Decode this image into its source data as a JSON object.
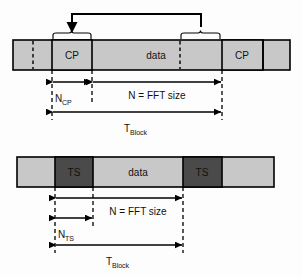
{
  "figure": {
    "title": "",
    "type": "timing-diagram",
    "colors": {
      "page_background": "#fdfdfd",
      "block_fill_light": "#c8c8c8",
      "block_fill_data": "#c8c8c8",
      "block_fill_ts": "#4a4a4a",
      "outline": "#000000",
      "text": "#111111"
    }
  },
  "diagrams": [
    {
      "id": "cp-ofdm",
      "name": "cyclic-prefix-ofdm-block",
      "blocks": [
        {
          "name": "leading-guard",
          "label": "",
          "x": 13,
          "w": 39,
          "fill": "#c8c8c8"
        },
        {
          "name": "cp-first",
          "label": "CP",
          "x": 52,
          "w": 40,
          "fill": "#c8c8c8"
        },
        {
          "name": "data",
          "label": "data",
          "x": 92,
          "w": 130,
          "fill": "#c8c8c8"
        },
        {
          "name": "cp-second",
          "label": "CP",
          "x": 222,
          "w": 41,
          "fill": "#c8c8c8"
        },
        {
          "name": "trailing-guard",
          "label": "",
          "x": 263,
          "w": 27,
          "fill": "#c8c8c8"
        }
      ],
      "dashed_marks": [
        {
          "name": "dashed-start-marker",
          "x": 33
        },
        {
          "name": "dashed-copy-source-marker",
          "x": 180
        }
      ],
      "copy_arrow": {
        "name": "cyclic-prefix-copy-arrow",
        "from_x": 180,
        "to_x": 72,
        "y": 14
      },
      "braces": [
        {
          "name": "brace-cp-destination",
          "x1": 52,
          "x2": 92
        },
        {
          "name": "brace-cp-source",
          "x1": 180,
          "x2": 222
        }
      ],
      "dimensions": [
        {
          "name": "dimension-n-cp",
          "label": "N",
          "sub": "CP",
          "x1": 52,
          "x2": 92,
          "y": 82,
          "label_x": 58,
          "label_y": 101
        },
        {
          "name": "dimension-n-fft",
          "label": "N = FFT size",
          "sub": "",
          "x1": 92,
          "x2": 222,
          "y": 82,
          "label_x": 124,
          "label_y": 99
        },
        {
          "name": "dimension-t-block",
          "label": "T",
          "sub": "Block",
          "x1": 52,
          "x2": 222,
          "y": 112,
          "label_x": 124,
          "label_y": 130
        }
      ]
    },
    {
      "id": "ts-sc-fde",
      "name": "training-sequence-block",
      "blocks": [
        {
          "name": "leading-guard",
          "label": "",
          "x": 17,
          "w": 38,
          "fill": "#c8c8c8"
        },
        {
          "name": "ts-first",
          "label": "TS",
          "x": 55,
          "w": 38,
          "fill": "#4a4a4a"
        },
        {
          "name": "data",
          "label": "data",
          "x": 93,
          "w": 90,
          "fill": "#c8c8c8"
        },
        {
          "name": "ts-second",
          "label": "TS",
          "x": 183,
          "w": 39,
          "fill": "#4a4a4a"
        },
        {
          "name": "trailing-guard",
          "label": "",
          "x": 222,
          "w": 52,
          "fill": "#c8c8c8"
        }
      ],
      "dashed_marks": [],
      "dimensions": [
        {
          "name": "dimension-n-fft",
          "label": "N = FFT size",
          "sub": "",
          "x1": 55,
          "x2": 183,
          "y": 198,
          "label_x": 100,
          "label_y": 215
        },
        {
          "name": "dimension-n-ts",
          "label": "N",
          "sub": "TS",
          "x1": 55,
          "x2": 93,
          "y": 218,
          "label_x": 62,
          "label_y": 237
        },
        {
          "name": "dimension-t-block",
          "label": "T",
          "sub": "Block",
          "x1": 55,
          "x2": 183,
          "y": 245,
          "label_x": 108,
          "label_y": 263
        }
      ]
    }
  ],
  "labels": {
    "cp": "CP",
    "ts": "TS",
    "data": "data",
    "n_fft": "N = FFT size",
    "n_base": "N",
    "n_cp_sub": "CP",
    "n_ts_sub": "TS",
    "t_base": "T",
    "t_block_sub": "Block"
  }
}
